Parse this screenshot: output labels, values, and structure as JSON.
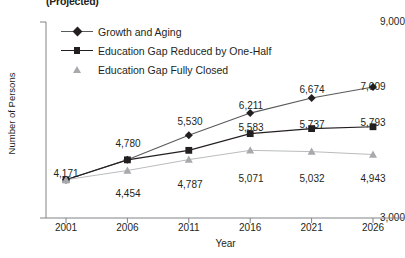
{
  "title": "(Projected)",
  "axes": {
    "ylabel": "Number of Persons",
    "xlabel": "Year",
    "ytick_top": "9,000",
    "ytick_bottom": "3,000"
  },
  "legend": [
    {
      "label": "Growth and Aging",
      "marker": "diamond-marker-icon",
      "color": "#58595b",
      "has_line": true
    },
    {
      "label": "Education Gap Reduced by One-Half",
      "marker": "square-marker-icon",
      "color": "#231f20",
      "has_line": true
    },
    {
      "label": "Education Gap Fully Closed",
      "marker": "triangle-marker-icon",
      "color": "#a7a9ac",
      "has_line": false
    }
  ],
  "chart_data": {
    "type": "line",
    "title": "(Projected)",
    "xlabel": "Year",
    "ylabel": "Number of Persons",
    "categories": [
      "2001",
      "2006",
      "2011",
      "2016",
      "2021",
      "2026"
    ],
    "ylim": [
      3000,
      9000
    ],
    "yticks": [
      3000,
      9000
    ],
    "grid": false,
    "legend_position": "top-left",
    "series": [
      {
        "name": "Growth and Aging",
        "marker": "diamond",
        "color": "#58595b",
        "values": [
          4171,
          4780,
          5530,
          6211,
          6674,
          7009
        ],
        "labels": [
          "4,171",
          "4,780",
          "5,530",
          "6,211",
          "6,674",
          "7,009"
        ]
      },
      {
        "name": "Education Gap Reduced by One-Half",
        "marker": "square",
        "color": "#231f20",
        "values": [
          4171,
          4780,
          5071,
          5583,
          5737,
          5793
        ],
        "labels": [
          "4,171",
          "4,780",
          "",
          "5,583",
          "5,737",
          "5,793"
        ]
      },
      {
        "name": "Education Gap Fully Closed",
        "marker": "triangle",
        "color": "#a7a9ac",
        "values": [
          4171,
          4454,
          4787,
          5071,
          5032,
          4943
        ],
        "labels": [
          "",
          "4,454",
          "4,787",
          "5,071",
          "5,032",
          "4,943"
        ]
      }
    ],
    "point_labels": [
      {
        "text": "4,171",
        "x": 66,
        "y": 168
      },
      {
        "text": "4,780",
        "x": 128,
        "y": 138
      },
      {
        "text": "4,454",
        "x": 128,
        "y": 188
      },
      {
        "text": "5,530",
        "x": 190,
        "y": 116
      },
      {
        "text": "4,787",
        "x": 190,
        "y": 179
      },
      {
        "text": "6,211",
        "x": 251,
        "y": 100
      },
      {
        "text": "5,583",
        "x": 251,
        "y": 122
      },
      {
        "text": "5,071",
        "x": 251,
        "y": 173
      },
      {
        "text": "6,674",
        "x": 312,
        "y": 84
      },
      {
        "text": "5,737",
        "x": 312,
        "y": 119
      },
      {
        "text": "5,032",
        "x": 312,
        "y": 173
      },
      {
        "text": "7,009",
        "x": 373,
        "y": 81
      },
      {
        "text": "5,793",
        "x": 373,
        "y": 117
      },
      {
        "text": "4,943",
        "x": 373,
        "y": 173
      }
    ]
  }
}
